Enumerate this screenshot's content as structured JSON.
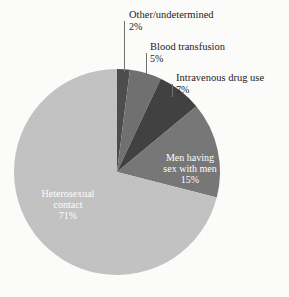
{
  "chart_data": {
    "type": "pie",
    "title": "",
    "subtitle": "",
    "xlabel": "",
    "ylabel": "",
    "legend_position": "none",
    "grid": false,
    "units": "percent",
    "total": 100,
    "start_angle_deg": 0,
    "direction": "clockwise",
    "categories": [
      "Other/undetermined",
      "Blood transfusion",
      "Intravenous drug use",
      "Men having sex with men",
      "Heterosexual contact"
    ],
    "values": [
      2,
      5,
      7,
      15,
      71
    ],
    "slices": [
      {
        "label": "Other/undetermined",
        "value": 2,
        "value_text": "2%",
        "color": "#4a4a4a",
        "label_placement": "outside",
        "label_color": "#17171a"
      },
      {
        "label": "Blood transfusion",
        "value": 5,
        "value_text": "5%",
        "color": "#6e6e6e",
        "label_placement": "outside",
        "label_color": "#17171a"
      },
      {
        "label": "Intravenous drug use",
        "value": 7,
        "value_text": "7%",
        "color": "#3e3e3e",
        "label_placement": "outside",
        "label_color": "#17171a"
      },
      {
        "label": "Men having sex with men",
        "label_line1": "Men having",
        "label_line2": "sex with men",
        "value": 15,
        "value_text": "15%",
        "color": "#757575",
        "label_placement": "inside",
        "label_color": "#ffffff"
      },
      {
        "label": "Heterosexual contact",
        "label_line1": "Heterosexual",
        "label_line2": "contact",
        "value": 71,
        "value_text": "71%",
        "color": "#c2c2c2",
        "label_placement": "inside",
        "label_color": "#ffffff"
      }
    ]
  },
  "figure": {
    "background_color": "#fdfdfb",
    "leader_line_color": "#6f6f6f",
    "pie_center_x": 117,
    "pie_center_y": 172,
    "pie_radius": 103
  }
}
